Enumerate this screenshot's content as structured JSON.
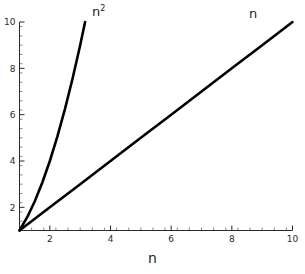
{
  "chart_data": {
    "type": "line",
    "title": "",
    "subtitle": "",
    "xlabel": "n",
    "ylabel": "",
    "xlim": [
      1,
      10
    ],
    "ylim": [
      1,
      10
    ],
    "grid": false,
    "legend_position": "inline-curve-labels",
    "x_ticks": [
      2,
      4,
      6,
      8,
      10
    ],
    "x_tick_labels": [
      "2",
      "4",
      "6",
      "8",
      "10"
    ],
    "x_minor_ticks_between": 4,
    "y_ticks": [
      2,
      4,
      6,
      8,
      10
    ],
    "y_tick_labels": [
      "2",
      "4",
      "6",
      "8",
      "10"
    ],
    "y_minor_ticks_between": 4,
    "line_color": "#000000",
    "axis_color": "#2b2b2b",
    "background": "#ffffff",
    "annotations": [
      {
        "name": "n-squared-label",
        "text": "n",
        "superscript": "2",
        "x": 3.3,
        "y": 10.4
      },
      {
        "name": "n-label",
        "text": "n",
        "superscript": "",
        "x": 8.9,
        "y": 10.4
      }
    ],
    "series": [
      {
        "name": "n",
        "label": "n",
        "x": [
          1,
          2,
          3,
          4,
          5,
          6,
          7,
          8,
          9,
          10
        ],
        "values": [
          1,
          2,
          3,
          4,
          5,
          6,
          7,
          8,
          9,
          10
        ]
      },
      {
        "name": "n^2",
        "label": "n²",
        "x": [
          1,
          1.25,
          1.5,
          1.75,
          2,
          2.25,
          2.5,
          2.75,
          3,
          3.1623
        ],
        "values": [
          1,
          1.5625,
          2.25,
          3.0625,
          4,
          5.0625,
          6.25,
          7.5625,
          9,
          10
        ]
      }
    ]
  },
  "axis_title": {
    "x": "n"
  }
}
